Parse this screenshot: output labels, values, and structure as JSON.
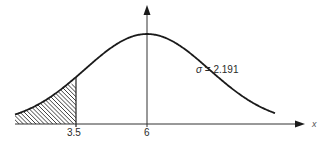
{
  "diagram": {
    "type": "normal-distribution-curve",
    "mean": 6,
    "sigma": 2.191,
    "shaded_region": {
      "from": "-inf",
      "to": 3.5,
      "pattern": "diagonal-hatch"
    },
    "labels": {
      "tick_left": "3.5",
      "tick_mean": "6",
      "x_axis": "x",
      "sigma_symbol": "σ",
      "sigma_eq": " = 2.191"
    },
    "colors": {
      "curve": "#1a1a1a",
      "axis": "#333333",
      "hatch": "#2a2a2a",
      "background": "#ffffff"
    },
    "geometry": {
      "baseline_y": 124,
      "mean_px": 147,
      "left_tick_px": 76,
      "peak_y": 34,
      "x_start_px": 15,
      "x_end_px": 275,
      "axis_end_px": 305,
      "vaxis_top_y": 5
    }
  }
}
